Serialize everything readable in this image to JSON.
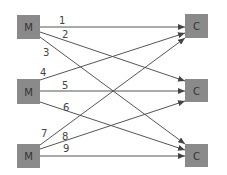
{
  "diagram": {
    "colors": {
      "node_fill": "#8a8a8a",
      "edge": "#555555",
      "background": "#ffffff"
    },
    "sources": [
      {
        "id": "m1",
        "label": "M",
        "x": 17,
        "y": 15,
        "w": 23,
        "h": 24
      },
      {
        "id": "m2",
        "label": "M",
        "x": 17,
        "y": 79,
        "w": 23,
        "h": 25
      },
      {
        "id": "m3",
        "label": "M",
        "x": 17,
        "y": 144,
        "w": 23,
        "h": 24
      }
    ],
    "targets": [
      {
        "id": "c1",
        "label": "C",
        "x": 185,
        "y": 14,
        "w": 23,
        "h": 24
      },
      {
        "id": "c2",
        "label": "C",
        "x": 185,
        "y": 79,
        "w": 23,
        "h": 23
      },
      {
        "id": "c3",
        "label": "C",
        "x": 185,
        "y": 144,
        "w": 23,
        "h": 23
      }
    ],
    "edges": [
      {
        "label": "1",
        "from": "m1",
        "to": "c1",
        "x1": 40,
        "y1": 27,
        "x2": 185,
        "y2": 27,
        "lx": 59,
        "ly": 24
      },
      {
        "label": "2",
        "from": "m1",
        "to": "c2",
        "x1": 40,
        "y1": 32,
        "x2": 185,
        "y2": 81,
        "lx": 62,
        "ly": 38
      },
      {
        "label": "3",
        "from": "m1",
        "to": "c3",
        "x1": 40,
        "y1": 37,
        "x2": 185,
        "y2": 144,
        "lx": 43,
        "ly": 56
      },
      {
        "label": "4",
        "from": "m2",
        "to": "c1",
        "x1": 40,
        "y1": 80,
        "x2": 185,
        "y2": 33,
        "lx": 40,
        "ly": 76
      },
      {
        "label": "5",
        "from": "m2",
        "to": "c2",
        "x1": 40,
        "y1": 91,
        "x2": 185,
        "y2": 91,
        "lx": 62,
        "ly": 89
      },
      {
        "label": "6",
        "from": "m2",
        "to": "c3",
        "x1": 40,
        "y1": 102,
        "x2": 185,
        "y2": 150,
        "lx": 63,
        "ly": 111
      },
      {
        "label": "7",
        "from": "m3",
        "to": "c1",
        "x1": 40,
        "y1": 145,
        "x2": 185,
        "y2": 38,
        "lx": 41,
        "ly": 137
      },
      {
        "label": "8",
        "from": "m3",
        "to": "c2",
        "x1": 40,
        "y1": 149,
        "x2": 185,
        "y2": 101,
        "lx": 62,
        "ly": 140
      },
      {
        "label": "9",
        "from": "m3",
        "to": "c3",
        "x1": 40,
        "y1": 156,
        "x2": 185,
        "y2": 156,
        "lx": 63,
        "ly": 152
      }
    ]
  }
}
